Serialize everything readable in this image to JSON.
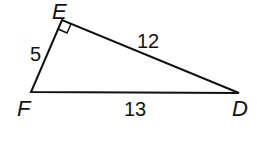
{
  "diagram": {
    "type": "right-triangle",
    "vertices": [
      {
        "name": "E",
        "x": 62,
        "y": 20,
        "label_x": 52,
        "label_y": 19
      },
      {
        "name": "F",
        "x": 31,
        "y": 92,
        "label_x": 17,
        "label_y": 116
      },
      {
        "name": "D",
        "x": 239,
        "y": 93,
        "label_x": 232,
        "label_y": 116
      }
    ],
    "sides": [
      {
        "between": "E-F",
        "length": "5",
        "label_x": 30,
        "label_y": 61
      },
      {
        "between": "E-D",
        "length": "12",
        "label_x": 137,
        "label_y": 48
      },
      {
        "between": "F-D",
        "length": "13",
        "label_x": 124,
        "label_y": 116
      }
    ],
    "right_angle_at": "E",
    "stroke_color": "#111111"
  }
}
